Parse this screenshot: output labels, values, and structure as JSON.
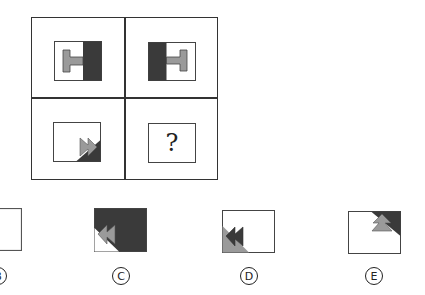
{
  "puzzle": {
    "type": "figure-analogy-matrix",
    "grid": {
      "rows": 2,
      "cols": 2,
      "cells": [
        {
          "position": "top-left",
          "description": "gray I-beam (T-shape) pointing right into dark right half"
        },
        {
          "position": "top-right",
          "description": "dark left half with gray I-beam pointing left, mirrored"
        },
        {
          "position": "bottom-left",
          "description": "gray double-arrow pointing right at bottom-right dark triangle corner"
        },
        {
          "position": "bottom-right",
          "text": "?"
        }
      ]
    },
    "question_mark": "?",
    "options": [
      {
        "label": "B",
        "glyph": "Ⓑ",
        "description": "empty box (partially cut off)"
      },
      {
        "label": "C",
        "glyph": "Ⓒ",
        "description": "dark box with white bottom-left triangle, gray double-arrow pointing left"
      },
      {
        "label": "D",
        "glyph": "Ⓓ",
        "description": "white box with gray bottom-left triangle, dark double-arrow pointing left"
      },
      {
        "label": "E",
        "glyph": "Ⓔ",
        "description": "white box with dark top-right triangle, gray double-arrow pointing up"
      }
    ]
  },
  "colors": {
    "dark": "#3a3a3a",
    "gray": "#9a9a9a",
    "border": "#333333",
    "background": "#ffffff"
  }
}
